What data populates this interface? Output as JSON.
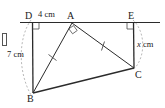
{
  "figure": {
    "type": "geometry-diagram",
    "width": 165,
    "height": 108,
    "stroke_color": "#2b2b2b",
    "dashed_color": "#9a9a9a",
    "text_color": "#1a1a1a"
  },
  "points": {
    "D": {
      "label": "D",
      "x": 32,
      "y": 22,
      "label_x": 26,
      "label_y": 12
    },
    "A": {
      "label": "A",
      "x": 72,
      "y": 22,
      "label_x": 68,
      "label_y": 12
    },
    "E": {
      "label": "E",
      "x": 133,
      "y": 22,
      "label_x": 129,
      "label_y": 12
    },
    "B": {
      "label": "B",
      "x": 33,
      "y": 93,
      "label_x": 28,
      "label_y": 96
    },
    "C": {
      "label": "C",
      "x": 134,
      "y": 68,
      "label_x": 135,
      "label_y": 71
    }
  },
  "dimensions": {
    "top_segment": {
      "label": "4 cm",
      "x": 39,
      "y": 11
    },
    "left_segment": {
      "label": "7 cm",
      "x": 8,
      "y": 51
    },
    "right_segment": {
      "label_value": "x",
      "label_unit": " cm",
      "x": 138,
      "y": 41
    }
  },
  "marks": {
    "right_angles": [
      "D",
      "A",
      "E"
    ],
    "equal_ticks": [
      "AB",
      "AC"
    ],
    "dashed_arcs": [
      "D-B",
      "E-C"
    ]
  },
  "segments": [
    {
      "name": "DE",
      "from": "D",
      "to": "E"
    },
    {
      "name": "DB",
      "from": "D",
      "to": "B"
    },
    {
      "name": "BC",
      "from": "B",
      "to": "C"
    },
    {
      "name": "CE",
      "from": "C",
      "to": "E"
    },
    {
      "name": "AB",
      "from": "A",
      "to": "B"
    },
    {
      "name": "AC",
      "from": "A",
      "to": "C"
    }
  ]
}
